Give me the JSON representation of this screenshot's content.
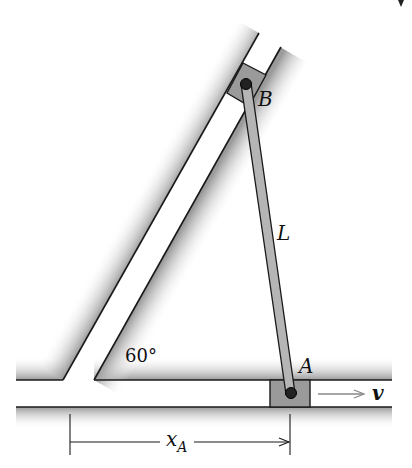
{
  "figure": {
    "type": "mechanism-diagram",
    "labels": {
      "point_b": "B",
      "point_a": "A",
      "rod_length": "L",
      "angle": "60°",
      "velocity": "v",
      "dimension_main": "x",
      "dimension_sub": "A"
    },
    "colors": {
      "line": "#1a1a1a",
      "block_fill": "#9a9a9a",
      "rod_fill": "#b5b5b5",
      "pin_fill": "#222222",
      "shade": "#8c8c8c",
      "arrow": "#888888"
    }
  }
}
